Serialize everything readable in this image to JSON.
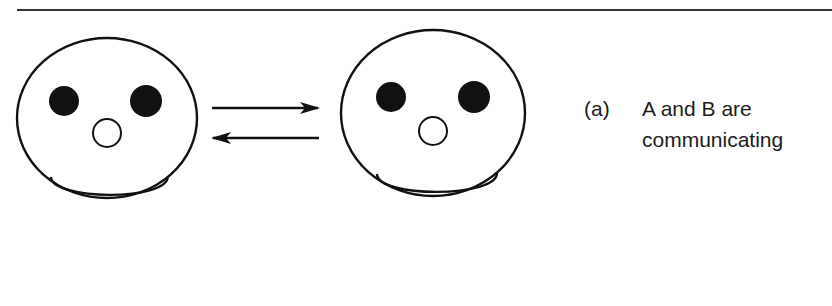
{
  "figure": {
    "caption": {
      "label": "(a)",
      "lines": [
        "A and B are",
        "communicating"
      ]
    },
    "participants": [
      {
        "id": "A",
        "description": "smiley face with filled eyes, open circle mouth, smile"
      },
      {
        "id": "B",
        "description": "smiley face with filled eyes, open circle mouth, smile"
      }
    ],
    "arrows": [
      {
        "from": "A",
        "to": "B",
        "direction": "right"
      },
      {
        "from": "B",
        "to": "A",
        "direction": "left"
      }
    ],
    "colors": {
      "stroke": "#111111",
      "fill": "#111111",
      "background": "#ffffff"
    }
  }
}
